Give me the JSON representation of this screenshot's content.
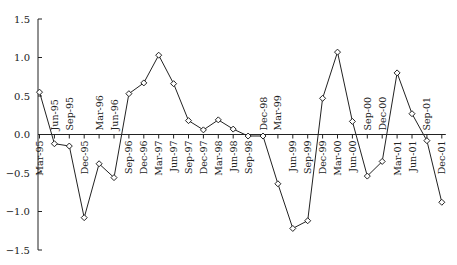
{
  "chart_data": {
    "type": "line",
    "title": "",
    "xlabel": "",
    "ylabel": "",
    "ylim": [
      -1.5,
      1.5
    ],
    "yticks": [
      1.5,
      1.0,
      0.5,
      0.0,
      -0.5,
      -1.0,
      -1.5
    ],
    "ytick_labels": [
      "1.5",
      "1.0",
      "0.5",
      "0.0",
      "−0.5",
      "−1.0",
      "−1.5"
    ],
    "grid": false,
    "legend": null,
    "marker": "diamond-open",
    "line_color": "#222222",
    "categories": [
      "Mar-95",
      "Jun-95",
      "Sep-95",
      "Dec-95",
      "Mar-96",
      "Jun-96",
      "Sep-96",
      "Dec-96",
      "Mar-97",
      "Jun-97",
      "Sep-97",
      "Dec-97",
      "Mar-98",
      "Jun-98",
      "Sep-98",
      "Dec-98",
      "Mar-99",
      "Jun-99",
      "Sep-99",
      "Dec-99",
      "Mar-00",
      "Jun-00",
      "Sep-00",
      "Dec-00",
      "Mar-01",
      "Jun-01",
      "Sep-01",
      "Dec-01"
    ],
    "label_position": [
      "below",
      "above",
      "above",
      "below",
      "above",
      "above",
      "below",
      "below",
      "below",
      "below",
      "below",
      "below",
      "below",
      "below",
      "below",
      "above",
      "above",
      "below",
      "below",
      "below",
      "below",
      "below",
      "above",
      "above",
      "below",
      "below",
      "above",
      "below"
    ],
    "values": [
      0.55,
      -0.12,
      -0.15,
      -1.08,
      -0.38,
      -0.56,
      0.53,
      0.67,
      1.03,
      0.66,
      0.18,
      0.06,
      0.19,
      0.07,
      -0.02,
      -0.02,
      -0.64,
      -1.22,
      -1.12,
      0.47,
      1.07,
      0.17,
      -0.54,
      -0.35,
      0.8,
      0.27,
      -0.08,
      -0.88
    ]
  }
}
